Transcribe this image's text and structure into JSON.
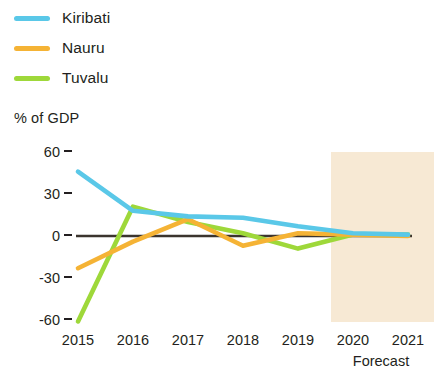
{
  "legend": {
    "items": [
      {
        "label": "Kiribati",
        "color": "#5ac8e8"
      },
      {
        "label": "Nauru",
        "color": "#f5b335"
      },
      {
        "label": "Tuvalu",
        "color": "#9ed83a"
      }
    ]
  },
  "axis": {
    "y_title": "% of GDP",
    "y_ticks": [
      "60",
      "30",
      "0",
      "-30",
      "-60"
    ],
    "x_ticks": [
      "2015",
      "2016",
      "2017",
      "2018",
      "2019",
      "2020",
      "2021"
    ],
    "forecast_label": "Forecast"
  },
  "colors": {
    "kiribati": "#5ac8e8",
    "nauru": "#f5b335",
    "tuvalu": "#9ed83a",
    "zero_line": "#3b342e",
    "forecast_band": "#f7e9d4",
    "text": "#231f20"
  },
  "chart_data": {
    "type": "line",
    "title": "",
    "subtitle": "",
    "xlabel": "",
    "ylabel": "% of GDP",
    "x": [
      2015,
      2016,
      2017,
      2018,
      2019,
      2020,
      2021
    ],
    "xlim": [
      2015,
      2021
    ],
    "ylim": [
      -70,
      65
    ],
    "ytick_values": [
      60,
      30,
      0,
      -30,
      -60
    ],
    "grid": false,
    "legend_position": "top-left",
    "zero_line": 0,
    "annotations": [
      {
        "text": "Forecast",
        "x_start": 2019.6,
        "x_end": 2021,
        "type": "shaded-band"
      }
    ],
    "series": [
      {
        "name": "Kiribati",
        "color": "#5ac8e8",
        "values": [
          46,
          18,
          14,
          13,
          7,
          2,
          1
        ]
      },
      {
        "name": "Nauru",
        "color": "#f5b335",
        "values": [
          -23,
          -4,
          12,
          -7,
          2,
          1,
          0
        ]
      },
      {
        "name": "Tuvalu",
        "color": "#9ed83a",
        "values": [
          -61,
          21,
          10,
          2,
          -9,
          1,
          1
        ]
      }
    ]
  }
}
